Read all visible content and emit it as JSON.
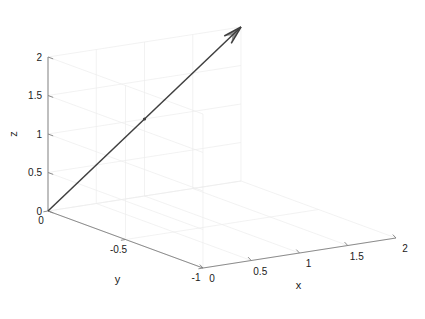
{
  "figure": {
    "type": "3d-vector-plot",
    "background_color": "#ffffff",
    "axis_line_color": "#808080",
    "grid_color": "#ececec",
    "vector_color": "#3f3f3f",
    "text_color": "#1a1a1a",
    "width": 425,
    "height": 319
  },
  "chart_data": {
    "type": "scatter",
    "title": "",
    "xlabel": "x",
    "ylabel": "y",
    "zlabel": "z",
    "xlim": [
      0,
      2
    ],
    "ylim": [
      -1,
      0
    ],
    "zlim": [
      0,
      2
    ],
    "xticks": [
      0,
      0.5,
      1,
      1.5,
      2
    ],
    "yticks": [
      -1,
      -0.5,
      0
    ],
    "zticks": [
      0,
      0.5,
      1,
      1.5,
      2
    ],
    "xtick_labels": [
      "0",
      "0.5",
      "1",
      "1.5",
      "2"
    ],
    "ytick_labels": [
      "-1",
      "-0.5",
      "0"
    ],
    "ztick_labels": [
      "0",
      "0.5",
      "1",
      "1.5",
      "2"
    ],
    "grid": true,
    "legend": "none",
    "series": [
      {
        "name": "vector",
        "type": "arrow",
        "start": [
          0,
          0,
          0
        ],
        "end": [
          2,
          0,
          2
        ],
        "marker_at": [
          1,
          0,
          1
        ],
        "color": "#3f3f3f"
      }
    ],
    "annotations": []
  },
  "axes": {
    "x": {
      "label": "x",
      "ticks": [
        {
          "value": 0,
          "label": "0"
        },
        {
          "value": 0.5,
          "label": "0.5"
        },
        {
          "value": 1,
          "label": "1"
        },
        {
          "value": 1.5,
          "label": "1.5"
        },
        {
          "value": 2,
          "label": "2"
        }
      ]
    },
    "y": {
      "label": "y",
      "ticks": [
        {
          "value": 0,
          "label": "0"
        },
        {
          "value": -0.5,
          "label": "-0.5"
        },
        {
          "value": -1,
          "label": "-1"
        }
      ]
    },
    "z": {
      "label": "z",
      "ticks": [
        {
          "value": 0,
          "label": "0"
        },
        {
          "value": 0.5,
          "label": "0.5"
        },
        {
          "value": 1,
          "label": "1"
        },
        {
          "value": 1.5,
          "label": "1.5"
        },
        {
          "value": 2,
          "label": "2"
        }
      ]
    }
  }
}
